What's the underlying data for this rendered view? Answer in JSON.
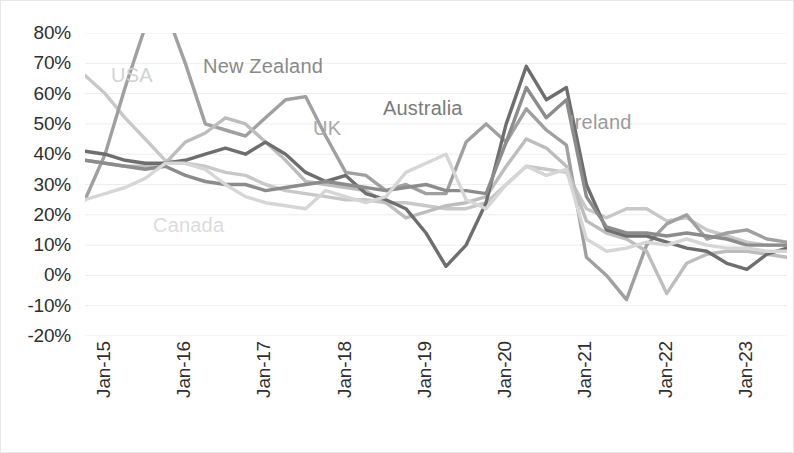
{
  "chart_data": {
    "type": "line",
    "title": "",
    "xlabel": "",
    "ylabel": "",
    "ylim": [
      -20,
      80
    ],
    "ytick_labels": [
      "80%",
      "70%",
      "60%",
      "50%",
      "40%",
      "30%",
      "20%",
      "10%",
      "0%",
      "-10%",
      "-20%"
    ],
    "ytick_values": [
      80,
      70,
      60,
      50,
      40,
      30,
      20,
      10,
      0,
      -10,
      -20
    ],
    "xtick_labels": [
      "Jan-15",
      "Jan-16",
      "Jan-17",
      "Jan-18",
      "Jan-19",
      "Jan-20",
      "Jan-21",
      "Jan-22",
      "Jan-23"
    ],
    "xtick_values": [
      2015.0,
      2016.0,
      2017.0,
      2018.0,
      2019.0,
      2020.0,
      2021.0,
      2022.0,
      2023.0
    ],
    "xlim": [
      2015.0,
      2023.75
    ],
    "grid": "horizontal",
    "legend_position": "inline-annotations",
    "x": [
      2015.0,
      2015.25,
      2015.5,
      2015.75,
      2016.0,
      2016.25,
      2016.5,
      2016.75,
      2017.0,
      2017.25,
      2017.5,
      2017.75,
      2018.0,
      2018.25,
      2018.5,
      2018.75,
      2019.0,
      2019.25,
      2019.5,
      2019.75,
      2020.0,
      2020.25,
      2020.5,
      2020.75,
      2021.0,
      2021.25,
      2021.5,
      2021.75,
      2022.0,
      2022.25,
      2022.5,
      2022.75,
      2023.0,
      2023.25,
      2023.5,
      2023.75
    ],
    "series": [
      {
        "name": "USA",
        "color": "#c8c8c8",
        "values": [
          66,
          60,
          52,
          45,
          38,
          37,
          36,
          34,
          33,
          30,
          28,
          27,
          26,
          25,
          25,
          24,
          24,
          23,
          22,
          22,
          24,
          30,
          36,
          35,
          34,
          22,
          19,
          22,
          22,
          18,
          19,
          15,
          13,
          11,
          10,
          10
        ]
      },
      {
        "name": "New Zealand",
        "color": "#a0a0a0",
        "values": [
          25,
          40,
          62,
          82,
          88,
          70,
          50,
          48,
          46,
          52,
          58,
          59,
          46,
          34,
          33,
          28,
          30,
          27,
          27,
          44,
          50,
          44,
          55,
          48,
          43,
          6,
          0,
          -8,
          10,
          17,
          20,
          12,
          14,
          15,
          12,
          11
        ]
      },
      {
        "name": "UK",
        "color": "#bdbdbd",
        "values": [
          38,
          37,
          36,
          36,
          37,
          44,
          47,
          52,
          50,
          44,
          38,
          31,
          30,
          29,
          28,
          24,
          19,
          21,
          23,
          24,
          26,
          36,
          45,
          42,
          36,
          18,
          14,
          12,
          8,
          -6,
          4,
          7,
          8,
          8,
          7,
          6
        ]
      },
      {
        "name": "Australia",
        "color": "#6e6e6e",
        "values": [
          41,
          40,
          38,
          37,
          37,
          38,
          40,
          42,
          40,
          44,
          40,
          34,
          31,
          33,
          27,
          25,
          22,
          14,
          3,
          10,
          24,
          50,
          69,
          58,
          62,
          30,
          15,
          13,
          13,
          11,
          9,
          8,
          4,
          2,
          7,
          9
        ]
      },
      {
        "name": "Ireland",
        "color": "#8c8c8c",
        "values": [
          38,
          37,
          36,
          35,
          36,
          33,
          31,
          30,
          30,
          28,
          29,
          30,
          31,
          30,
          29,
          28,
          29,
          30,
          28,
          28,
          27,
          44,
          62,
          52,
          58,
          26,
          16,
          14,
          14,
          13,
          14,
          13,
          12,
          10,
          10,
          10
        ]
      },
      {
        "name": "Canada",
        "color": "#d6d6d6",
        "values": [
          25,
          27,
          29,
          32,
          37,
          37,
          35,
          30,
          26,
          24,
          23,
          22,
          28,
          26,
          24,
          26,
          34,
          37,
          40,
          25,
          22,
          30,
          36,
          33,
          35,
          12,
          8,
          9,
          11,
          10,
          12,
          10,
          9,
          9,
          8,
          8
        ]
      }
    ],
    "annotations": [
      {
        "text": "USA",
        "color": "#d2d2d2",
        "x_px": 110,
        "y_px": 63
      },
      {
        "text": "New Zealand",
        "color": "#8a8a8a",
        "x_px": 202,
        "y_px": 54
      },
      {
        "text": "UK",
        "color": "#a8a8a8",
        "x_px": 312,
        "y_px": 116
      },
      {
        "text": "Australia",
        "color": "#7a7a7a",
        "x_px": 382,
        "y_px": 96
      },
      {
        "text": "Ireland",
        "color": "#9a9a9a",
        "x_px": 568,
        "y_px": 110
      },
      {
        "text": "Canada",
        "color": "#dcdcdc",
        "x_px": 152,
        "y_px": 213
      }
    ]
  }
}
